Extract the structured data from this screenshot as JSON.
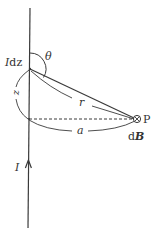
{
  "diagram": {
    "labels": {
      "current_element": "Idz",
      "current_element_I": "I",
      "current_element_dz": "dz",
      "angle": "θ",
      "distance_r": "r",
      "distance_z": "z",
      "distance_a": "a",
      "point": "P",
      "field_d": "d",
      "field_B": "B",
      "current": "I"
    },
    "symbols": {
      "field_direction": "into-page (⊗)"
    },
    "colors": {
      "line": "#3a3a3a",
      "text": "#333333",
      "background": "#ffffff"
    }
  }
}
